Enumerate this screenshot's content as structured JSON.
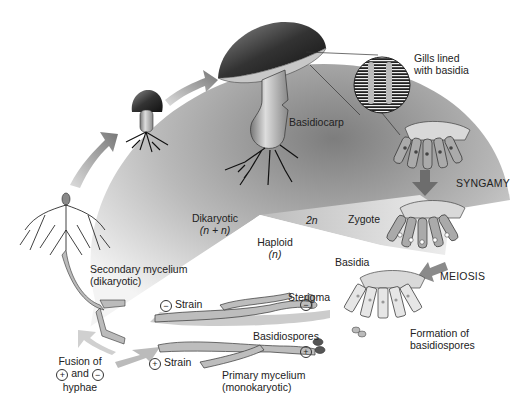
{
  "labels": {
    "gills": [
      "Gills lined",
      "with basidia"
    ],
    "basidiocarp": "Basidiocarp",
    "syngamy": "SYNGAMY",
    "dikaryotic": "Dikaryotic",
    "dikaryotic_ploidy": "(n + n)",
    "two_n": "2n",
    "zygote": "Zygote",
    "haploid": "Haploid",
    "haploid_ploidy": "(n)",
    "basidia": "Basidia",
    "meiosis": "MEIOSIS",
    "secondary_mycelium": "Secondary mycelium",
    "secondary_mycelium_type": "(dikaryotic)",
    "sterigma": "Sterigma",
    "minus_strain": "Strain",
    "plus_strain": "Strain",
    "basidiospores": "Basidiospores",
    "formation": [
      "Formation of",
      "basidiospores"
    ],
    "primary_mycelium": "Primary mycelium",
    "primary_mycelium_type": "(monokaryotic)",
    "fusion": [
      "Fusion of",
      "and",
      "hyphae"
    ],
    "minus_sign": "−",
    "plus_sign": "+"
  },
  "colors": {
    "dikaryotic_region": "#8c8c8c",
    "haploid_region": "#ffffff",
    "diploid_region": "#d6d6d6",
    "arrow": "#7a7a7a",
    "ink": "#222222"
  }
}
